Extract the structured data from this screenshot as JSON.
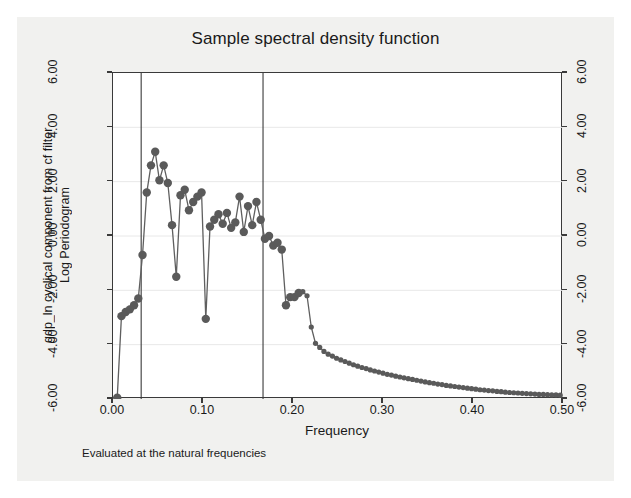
{
  "figure": {
    "title": "Sample spectral density function",
    "note": "Evaluated at the natural frequencies",
    "background": "#f1f1ef",
    "plot_background": "#ffffff",
    "frame_color": "#3a3a3a",
    "series_color": "#5f5f5f",
    "marker_color": "#5a5a5a"
  },
  "axes": {
    "x_title": "Frequency",
    "y_title_line1": "gdp_ln cyclical component from cf filter",
    "y_title_line2": "Log Periodogram",
    "x_ticks": [
      "0.00",
      "0.10",
      "0.20",
      "0.30",
      "0.40",
      "0.50"
    ],
    "y_ticks_left": [
      "6.00",
      "4.00",
      "2.00",
      "0.00",
      "-2.00",
      "-4.00",
      "-6.00"
    ],
    "y_ticks_right": [
      "6.00",
      "4.00",
      "2.00",
      "0.00",
      "-2.00",
      "-4.00",
      "-6.00"
    ]
  },
  "chart_data": {
    "type": "line",
    "title": "Sample spectral density function",
    "subtitle": "Evaluated at the natural frequencies",
    "xlabel": "Frequency",
    "ylabel": "gdp_ln cyclical component from cf filter / Log Periodogram",
    "xlim": [
      0.0,
      0.5
    ],
    "ylim": [
      -6.0,
      6.0
    ],
    "xticks": [
      0.0,
      0.1,
      0.2,
      0.3,
      0.4,
      0.5
    ],
    "yticks": [
      -6.0,
      -4.0,
      -2.0,
      0.0,
      2.0,
      4.0,
      6.0
    ],
    "grid": true,
    "grid_axis": "y",
    "legend": "none",
    "markers": "filled-circle",
    "annotations": [
      {
        "type": "vline",
        "x": 0.0313,
        "label": "lower business-cycle frequency"
      },
      {
        "type": "vline",
        "x": 0.1667,
        "label": "upper business-cycle frequency"
      }
    ],
    "series": [
      {
        "name": "Log periodogram",
        "x": [
          0.0047,
          0.0094,
          0.0141,
          0.0187,
          0.0234,
          0.0281,
          0.0328,
          0.0375,
          0.0422,
          0.0469,
          0.0516,
          0.0563,
          0.0609,
          0.0656,
          0.0703,
          0.075,
          0.0797,
          0.0844,
          0.0891,
          0.0938,
          0.0984,
          0.1031,
          0.1078,
          0.1125,
          0.1172,
          0.1219,
          0.1266,
          0.1313,
          0.1359,
          0.1406,
          0.1453,
          0.15,
          0.1547,
          0.1594,
          0.1641,
          0.1688,
          0.1734,
          0.1781,
          0.1828,
          0.1875,
          0.1922,
          0.1969,
          0.2016,
          0.2063,
          0.2109,
          0.2156,
          0.2203,
          0.225,
          0.2297,
          0.2344,
          0.2391,
          0.2438,
          0.2484,
          0.2531,
          0.2578,
          0.2625,
          0.2672,
          0.2719,
          0.2766,
          0.2813,
          0.2859,
          0.2906,
          0.2953,
          0.3,
          0.3047,
          0.3094,
          0.3141,
          0.3188,
          0.3234,
          0.3281,
          0.3328,
          0.3375,
          0.3422,
          0.3469,
          0.3516,
          0.3563,
          0.3609,
          0.3656,
          0.3703,
          0.375,
          0.3797,
          0.3844,
          0.3891,
          0.3938,
          0.3984,
          0.4031,
          0.4078,
          0.4125,
          0.4172,
          0.4219,
          0.4266,
          0.4313,
          0.4359,
          0.4406,
          0.4453,
          0.45,
          0.4547,
          0.4594,
          0.4641,
          0.4688,
          0.4734,
          0.4781,
          0.4828,
          0.4875,
          0.4922,
          0.4969
        ],
        "y": [
          -5.95,
          -2.95,
          -2.8,
          -2.7,
          -2.55,
          -2.3,
          -0.7,
          1.6,
          2.6,
          3.1,
          2.05,
          2.6,
          1.95,
          0.4,
          -1.5,
          1.5,
          1.7,
          0.95,
          1.25,
          1.45,
          1.6,
          -3.05,
          0.35,
          0.6,
          0.8,
          0.45,
          0.85,
          0.3,
          0.5,
          1.45,
          0.15,
          1.1,
          0.4,
          1.25,
          0.6,
          -0.1,
          0.0,
          -0.35,
          -0.25,
          -0.5,
          -2.55,
          -2.25,
          -2.25,
          -2.1,
          -2.05,
          -2.2,
          -3.35,
          -3.95,
          -4.1,
          -4.25,
          -4.35,
          -4.42,
          -4.5,
          -4.56,
          -4.62,
          -4.68,
          -4.74,
          -4.79,
          -4.84,
          -4.88,
          -4.93,
          -4.97,
          -5.01,
          -5.05,
          -5.09,
          -5.12,
          -5.16,
          -5.19,
          -5.22,
          -5.25,
          -5.28,
          -5.31,
          -5.34,
          -5.37,
          -5.4,
          -5.42,
          -5.45,
          -5.47,
          -5.5,
          -5.52,
          -5.54,
          -5.56,
          -5.58,
          -5.6,
          -5.62,
          -5.64,
          -5.66,
          -5.67,
          -5.69,
          -5.7,
          -5.72,
          -5.73,
          -5.75,
          -5.76,
          -5.77,
          -5.78,
          -5.79,
          -5.8,
          -5.81,
          -5.82,
          -5.83,
          -5.83,
          -5.84,
          -5.85,
          -5.85,
          -5.86
        ]
      }
    ]
  }
}
